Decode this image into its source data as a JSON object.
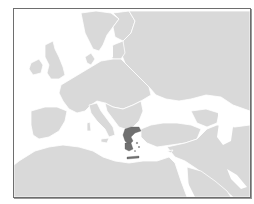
{
  "map": {
    "type": "locator-map",
    "region": "Europe and Mediterranean",
    "highlighted_country": "Greece",
    "colors": {
      "sea": "#ffffff",
      "land": "#d9d9d9",
      "borders": "#ffffff",
      "highlight": "#707070",
      "frame": "#6e6e6e"
    }
  }
}
